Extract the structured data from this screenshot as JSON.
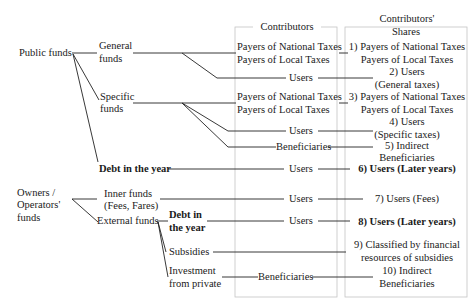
{
  "headers": {
    "contributors": "Contributors",
    "shares_line1": "Contributors'",
    "shares_line2": "Shares"
  },
  "sources": {
    "public_funds": "Public funds",
    "owners_line1": "Owners /",
    "owners_line2": "Operators'",
    "owners_line3": "funds"
  },
  "funds": {
    "general_1": "General",
    "general_2": "funds",
    "specific_1": "Specific",
    "specific_2": "funds",
    "debt_public": "Debt in the year",
    "inner_1": "Inner funds",
    "inner_2": "(Fees, Fares)",
    "external": "External funds",
    "debt_ext_1": "Debt in",
    "debt_ext_2": "the year",
    "subsidies": "Subsidies",
    "invest_1": "Investment",
    "invest_2": "from private"
  },
  "contributors": {
    "nat1": "Payers of National Taxes",
    "loc1": "Payers of Local Taxes",
    "users1": "Users",
    "nat2": "Payers of National Taxes",
    "loc2": "Payers of Local Taxes",
    "users2": "Users",
    "benef1": "Beneficiaries",
    "users3": "Users",
    "users4": "Users",
    "users5": "Users",
    "benef2": "Beneficiaries"
  },
  "shares": {
    "s1a": "1) Payers of National Taxes",
    "s1b": "Payers of Local Taxes",
    "s2a": "2) Users",
    "s2b": "(General taxes)",
    "s3a": "3) Payers of National Taxes",
    "s3b": "Payers of Local Taxes",
    "s4a": "4) Users",
    "s4b": "(Specific taxes)",
    "s5a": "5) Indirect",
    "s5b": "Beneficiaries",
    "s6": "6) Users (Later years)",
    "s7": "7) Users (Fees)",
    "s8": "8) Users (Later years)",
    "s9a": "9) Classified by financial",
    "s9b": "resources of subsidies",
    "s10a": "10) Indirect",
    "s10b": "Beneficiaries"
  },
  "colors": {
    "line": "#222222",
    "box": "#bbbbbb"
  }
}
